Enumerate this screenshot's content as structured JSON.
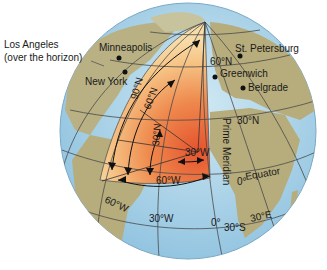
{
  "figure": {
    "colors": {
      "ocean": "#a9d3e8",
      "land": "#b6ac7c",
      "wedge_outer": "#f7d9a0",
      "wedge_inner": "#e8643a",
      "grid": "#4a4a4a",
      "text": "#1a1a1a"
    },
    "cities": [
      {
        "name": "Minneapolis"
      },
      {
        "name": "New York"
      },
      {
        "name": "St. Petersburg"
      },
      {
        "name": "Greenwich"
      },
      {
        "name": "Belgrade"
      }
    ],
    "callout": {
      "line1": "Los Angeles",
      "line2": "(over the horizon)"
    },
    "latitude_labels": {
      "lat60n": "60°N",
      "lat30n": "30°N",
      "equator_deg": "0°",
      "equator": "Equator",
      "lat30s": "30°S"
    },
    "longitude_labels": {
      "lon60w": "60°W",
      "lon30w": "30°W",
      "lon0": "0°",
      "lon30e": "30°E"
    },
    "prime_meridian": "Prime Meridian",
    "wedge_labels": {
      "a90n": "90°N",
      "a60n": "60°N",
      "a30n": "30°N",
      "a60w": "60°W",
      "a30w": "30°W"
    }
  }
}
